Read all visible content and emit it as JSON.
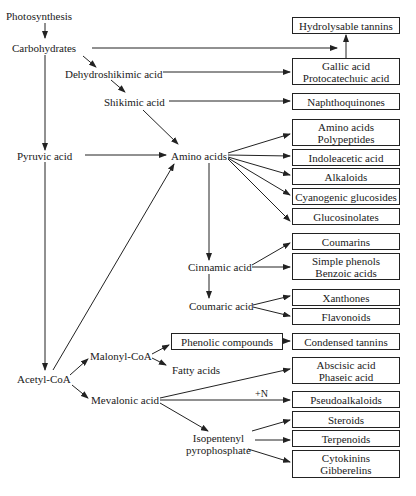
{
  "diagram": {
    "intermediates": {
      "photosynthesis": "Photosynthesis",
      "carbohydrates": "Carbohydrates",
      "dehydroshikimic_acid": "Dehydroshikimic acid",
      "shikimic_acid": "Shikimic acid",
      "pyruvic_acid": "Pyruvic acid",
      "amino_acids": "Amino acids",
      "cinnamic_acid": "Cinnamic acid",
      "coumaric_acid": "Coumaric acid",
      "acetyl_coa": "Acetyl-CoA",
      "malonyl_coa": "Malonyl-CoA",
      "fatty_acids": "Fatty acids",
      "mevalonic_acid": "Mevalonic acid",
      "isopentenyl_line1": "Isopentenyl",
      "isopentenyl_line2": "pyrophosphate"
    },
    "products": {
      "hydrolysable_tannins": "Hydrolysable tannins",
      "gallic_line1": "Gallic acid",
      "gallic_line2": "Protocatechuic acid",
      "naphthoquinones": "Naphthoquinones",
      "amino_line1": "Amino acids",
      "amino_line2": "Polypeptides",
      "indoleacetic_acid": "Indoleacetic acid",
      "alkaloids": "Alkaloids",
      "cyanogenic_glucosides": "Cyanogenic glucosides",
      "glucosinolates": "Glucosinolates",
      "coumarins": "Coumarins",
      "phenols_line1": "Simple phenols",
      "phenols_line2": "Benzoic acids",
      "xanthones": "Xanthones",
      "flavonoids": "Flavonoids",
      "phenolic_compounds": "Phenolic compounds",
      "condensed_tannins": "Condensed tannins",
      "abscisic_line1": "Abscisic acid",
      "abscisic_line2": "Phaseic acid",
      "pseudoalkaloids": "Pseudoalkaloids",
      "steroids": "Steroids",
      "terpenoids": "Terpenoids",
      "cytokinins_line1": "Cytokinins",
      "cytokinins_line2": "Gibberelins"
    },
    "annotations": {
      "plus_n": "+N"
    },
    "colors": {
      "line": "#222222",
      "background": "#ffffff"
    }
  }
}
